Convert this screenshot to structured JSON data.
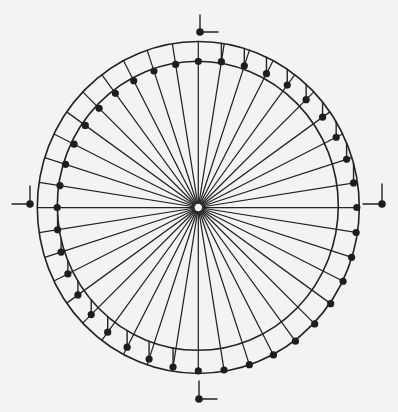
{
  "diagram": {
    "title": "Radial dial with offset dot circle",
    "canvas": {
      "width": 398,
      "height": 412,
      "background": "#f3f3f1"
    },
    "colors": {
      "ink": "#232323",
      "dot": "#1e1e1e",
      "background": "#f3f3f1"
    },
    "center": {
      "x": 198.3,
      "y": 207.5,
      "hole_radius": 4.2
    },
    "outer_ring": {
      "cx": 198.3,
      "cy": 207.5,
      "rx": 161,
      "ry": 166
    },
    "inner_ring": {
      "cx": 197.8,
      "cy": 205.8,
      "rx": 140.5,
      "ry": 144.5
    },
    "dot_curve": {
      "cx": 207,
      "cy": 216,
      "rx": 150,
      "ry": 155
    },
    "rays": {
      "count": 40,
      "start_angle_deg": 0,
      "step_deg": 9
    },
    "dot_radius": 3.6,
    "flags": {
      "upper_right": "vertical line from dot up to outer ring",
      "lower_left": "vertical line from dot up to inner ring"
    },
    "markers": [
      {
        "id": "north",
        "dot": [
          200,
          32
        ],
        "stem": [
          200,
          15
        ],
        "tick": [
          218,
          32
        ]
      },
      {
        "id": "west",
        "dot": [
          30,
          204
        ],
        "stem": [
          12,
          204
        ],
        "tick": [
          30,
          186
        ]
      },
      {
        "id": "east",
        "dot": [
          382,
          204
        ],
        "stem": [
          363,
          204
        ],
        "tick": [
          382,
          184
        ]
      },
      {
        "id": "south",
        "dot": [
          199,
          399
        ],
        "stem": [
          199,
          381
        ],
        "tick": [
          217,
          399
        ]
      }
    ],
    "marker_dot_radius": 3.8
  }
}
